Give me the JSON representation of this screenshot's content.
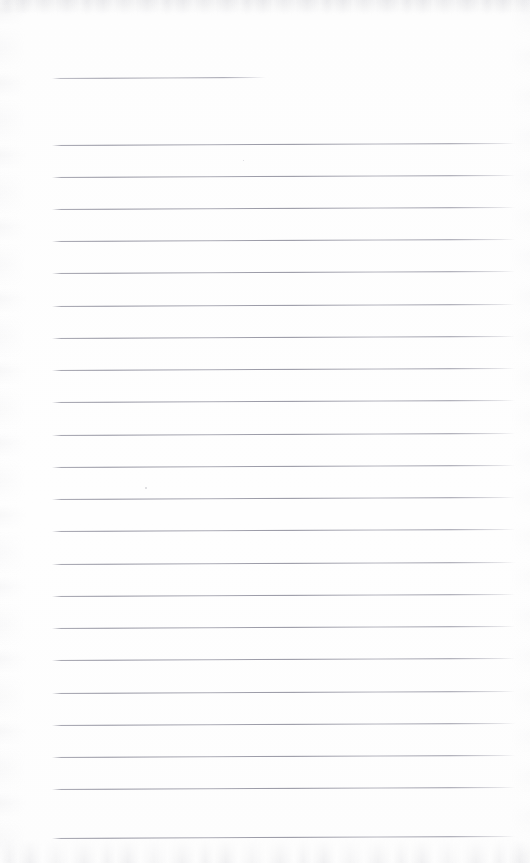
{
  "document": {
    "kind": "scanned-page",
    "title": "Blank ruled notebook page",
    "page_width": 530,
    "page_height": 863,
    "text_content": "",
    "handwriting_present": "none",
    "background_color": "#fdfdfd",
    "rule_color": "#8e8e9c",
    "edge_artifact_color": "#c9c9d1"
  },
  "ruling": {
    "style": "wide-ruled",
    "line_count": 23,
    "line_spacing_px": 32,
    "left_margin_px": 52,
    "right_end_px": 515,
    "tilt_degrees": -0.25,
    "note": "first rule is a short title rule ending early; a blank gap follows before the body rules begin"
  },
  "rules": [
    {
      "id": "rule-title",
      "y": 78,
      "x_start": 52,
      "x_end": 266,
      "type": "title"
    },
    {
      "id": "rule-1",
      "y": 145,
      "x_start": 52,
      "x_end": 515,
      "type": "body"
    },
    {
      "id": "rule-2",
      "y": 177,
      "x_start": 52,
      "x_end": 515,
      "type": "body"
    },
    {
      "id": "rule-3",
      "y": 209,
      "x_start": 52,
      "x_end": 515,
      "type": "body"
    },
    {
      "id": "rule-4",
      "y": 241,
      "x_start": 52,
      "x_end": 515,
      "type": "body"
    },
    {
      "id": "rule-5",
      "y": 273,
      "x_start": 52,
      "x_end": 515,
      "type": "body"
    },
    {
      "id": "rule-6",
      "y": 306,
      "x_start": 52,
      "x_end": 515,
      "type": "body"
    },
    {
      "id": "rule-7",
      "y": 338,
      "x_start": 52,
      "x_end": 515,
      "type": "body"
    },
    {
      "id": "rule-8",
      "y": 370,
      "x_start": 52,
      "x_end": 515,
      "type": "body"
    },
    {
      "id": "rule-9",
      "y": 402,
      "x_start": 52,
      "x_end": 515,
      "type": "body"
    },
    {
      "id": "rule-10",
      "y": 435,
      "x_start": 52,
      "x_end": 515,
      "type": "body"
    },
    {
      "id": "rule-11",
      "y": 467,
      "x_start": 52,
      "x_end": 515,
      "type": "body"
    },
    {
      "id": "rule-12",
      "y": 499,
      "x_start": 52,
      "x_end": 515,
      "type": "body"
    },
    {
      "id": "rule-13",
      "y": 531,
      "x_start": 52,
      "x_end": 515,
      "type": "body"
    },
    {
      "id": "rule-14",
      "y": 564,
      "x_start": 52,
      "x_end": 515,
      "type": "body"
    },
    {
      "id": "rule-15",
      "y": 596,
      "x_start": 52,
      "x_end": 515,
      "type": "body"
    },
    {
      "id": "rule-16",
      "y": 628,
      "x_start": 52,
      "x_end": 515,
      "type": "body"
    },
    {
      "id": "rule-17",
      "y": 660,
      "x_start": 52,
      "x_end": 515,
      "type": "body"
    },
    {
      "id": "rule-18",
      "y": 693,
      "x_start": 52,
      "x_end": 515,
      "type": "body"
    },
    {
      "id": "rule-19",
      "y": 725,
      "x_start": 52,
      "x_end": 515,
      "type": "body"
    },
    {
      "id": "rule-20",
      "y": 757,
      "x_start": 52,
      "x_end": 515,
      "type": "body"
    },
    {
      "id": "rule-21",
      "y": 789,
      "x_start": 52,
      "x_end": 515,
      "type": "body"
    },
    {
      "id": "rule-22",
      "y": 838,
      "x_start": 52,
      "x_end": 515,
      "type": "body"
    }
  ],
  "specks": [
    {
      "id": "speck-1",
      "x": 145,
      "y": 487,
      "size": 2
    },
    {
      "id": "speck-2",
      "x": 243,
      "y": 160,
      "size": 1
    }
  ]
}
